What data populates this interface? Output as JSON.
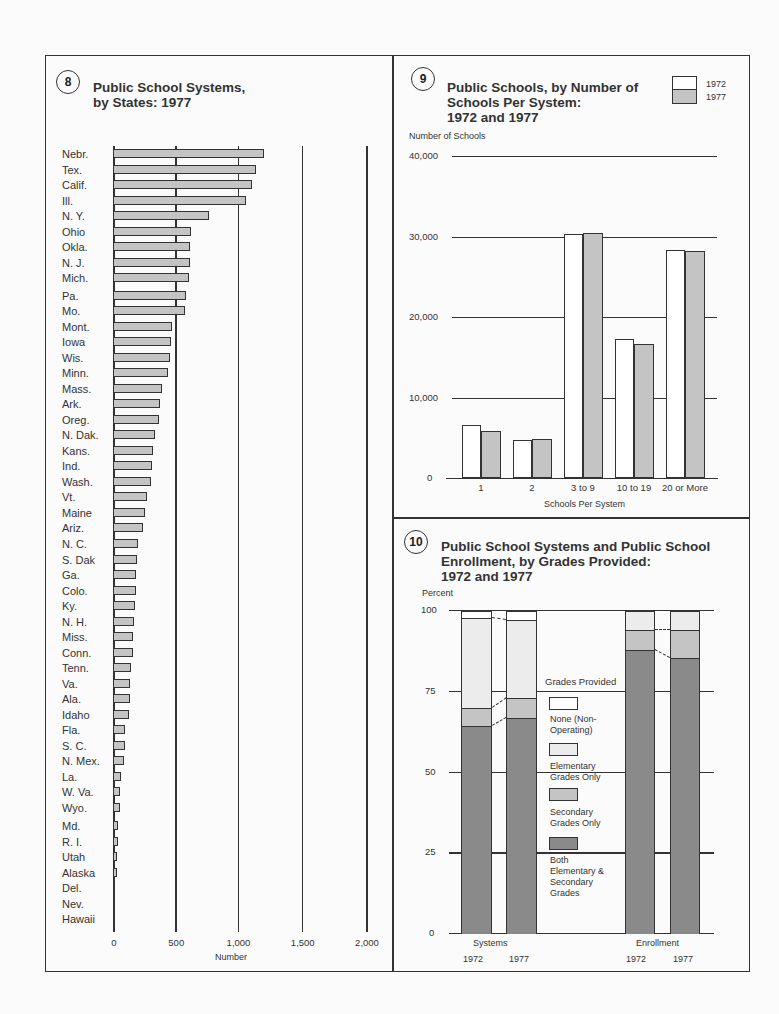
{
  "chart_data": [
    {
      "id": 8,
      "type": "bar",
      "orientation": "horizontal",
      "title": "Public School Systems, by States: 1977",
      "xlabel": "Number",
      "ylabel": "",
      "xlim": [
        0,
        2000
      ],
      "xticks": [
        "0",
        "500",
        "1,000",
        "1,500",
        "2,000"
      ],
      "grid": true,
      "categories": [
        "Nebr.",
        "Tex.",
        "Calif.",
        "Ill.",
        "N. Y.",
        "Ohio",
        "Okla.",
        "N. J.",
        "Mich.",
        "Pa.",
        "Mo.",
        "Mont.",
        "Iowa",
        "Wis.",
        "Minn.",
        "Mass.",
        "Ark.",
        "Oreg.",
        "N. Dak.",
        "Kans.",
        "Ind.",
        "Wash.",
        "Vt.",
        "Maine",
        "Ariz.",
        "N. C.",
        "S. Dak",
        "Ga.",
        "Colo.",
        "Ky.",
        "N. H.",
        "Miss.",
        "Conn.",
        "Tenn.",
        "Va.",
        "Ala.",
        "Idaho",
        "Fla.",
        "S. C.",
        "N. Mex.",
        "La.",
        "W. Va.",
        "Wyo.",
        "Md.",
        "R. I.",
        "Utah",
        "Alaska",
        "Del.",
        "Nev.",
        "Hawaii"
      ],
      "values": [
        1210,
        1150,
        1115,
        1065,
        775,
        625,
        620,
        622,
        612,
        585,
        582,
        472,
        465,
        455,
        440,
        390,
        380,
        372,
        340,
        322,
        315,
        307,
        275,
        260,
        243,
        203,
        195,
        188,
        185,
        180,
        165,
        160,
        160,
        142,
        140,
        135,
        125,
        100,
        98,
        90,
        68,
        57,
        57,
        38,
        38,
        36,
        30,
        19,
        17,
        1
      ]
    },
    {
      "id": 9,
      "type": "bar",
      "title": "Public Schools, by Number of Schools Per System: 1972 and 1977",
      "xlabel": "Schools Per System",
      "ylabel": "Number of Schools",
      "ylim": [
        0,
        40000
      ],
      "yticks": [
        "0",
        "10,000",
        "20,000",
        "30,000",
        "40,000"
      ],
      "grid": true,
      "legend_position": "top-right",
      "categories": [
        "1",
        "2",
        "3 to 9",
        "10 to 19",
        "20 or More"
      ],
      "series": [
        {
          "name": "1972",
          "color": "#ffffff",
          "values": [
            6600,
            4700,
            30300,
            17300,
            28300
          ]
        },
        {
          "name": "1977",
          "color": "#c4c4c4",
          "values": [
            5800,
            4850,
            30400,
            16600,
            28200
          ]
        }
      ]
    },
    {
      "id": 10,
      "type": "bar",
      "stacked": true,
      "title": "Public School Systems and Public School Enrollment, by Grades Provided: 1972 and 1977",
      "xlabel": "",
      "ylabel": "Percent",
      "ylim": [
        0,
        100
      ],
      "yticks": [
        "0",
        "25",
        "50",
        "75",
        "100"
      ],
      "grid": true,
      "legend_title": "Grades Provided",
      "groups": [
        "Systems",
        "Enrollment"
      ],
      "categories": [
        "Systems 1972",
        "Systems 1977",
        "Enrollment 1972",
        "Enrollment 1977"
      ],
      "series": [
        {
          "name": "Both Elementary & Secondary Grades",
          "color": "#8a8a8a",
          "values": [
            64.5,
            67.0,
            88.0,
            85.5
          ]
        },
        {
          "name": "Secondary Grades Only",
          "color": "#c4c4c4",
          "values": [
            5.5,
            6.0,
            6.0,
            8.5
          ]
        },
        {
          "name": "Elementary Grades Only",
          "color": "#ececec",
          "values": [
            27.8,
            24.2,
            6.0,
            6.0
          ]
        },
        {
          "name": "None (Non-Operating)",
          "color": "#ffffff",
          "values": [
            2.2,
            2.8,
            0,
            0
          ]
        }
      ]
    }
  ],
  "chart8": {
    "number": "8",
    "title_line1": "Public School Systems,",
    "title_line2": "by States:  1977",
    "xlabel": "Number",
    "ticks": [
      "0",
      "500",
      "1,000",
      "1,500",
      "2,000"
    ]
  },
  "chart9": {
    "number": "9",
    "title_line1": "Public Schools, by Number of",
    "title_line2": "Schools Per System:",
    "title_line3": "1972 and 1977",
    "ylabel": "Number of Schools",
    "yticks": [
      "40,000",
      "30,000",
      "20,000",
      "10,000",
      "0"
    ],
    "xlabel": "Schools Per System",
    "categories": [
      "1",
      "2",
      "3 to 9",
      "10 to 19",
      "20 or More"
    ],
    "legend": [
      "1972",
      "1977"
    ]
  },
  "chart10": {
    "number": "10",
    "title_line1": "Public School Systems and Public School",
    "title_line2": "Enrollment, by Grades Provided:",
    "title_line3": "1972 and 1977",
    "ylabel": "Percent",
    "yticks": [
      "100",
      "75",
      "50",
      "25",
      "0"
    ],
    "legend_title": "Grades Provided",
    "legend": [
      {
        "line1": "None (Non-",
        "line2": "Operating)"
      },
      {
        "line1": "Elementary",
        "line2": "Grades Only"
      },
      {
        "line1": "Secondary",
        "line2": "Grades Only"
      },
      {
        "line1": "Both",
        "line2": "Elementary &",
        "line3": "Secondary",
        "line4": "Grades"
      }
    ],
    "group_labels": [
      "Systems",
      "Enrollment"
    ],
    "year_labels": [
      "1972",
      "1977",
      "1972",
      "1977"
    ]
  }
}
